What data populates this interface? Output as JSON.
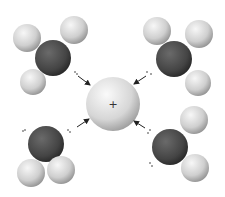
{
  "diagram": {
    "title": "",
    "colors": {
      "background": "#ffffff",
      "oxygen": "#4a4a4a",
      "hydrogen": "#d8d8d8",
      "cation": "#e0e0e0",
      "arrow": "#222222"
    },
    "cation": {
      "label": "+",
      "cx": 113,
      "cy": 104,
      "r": 27
    },
    "molecules": [
      {
        "id": "top-left",
        "oxygen": {
          "cx": 53,
          "cy": 58,
          "r": 18
        },
        "hydrogens": [
          {
            "cx": 27,
            "cy": 38,
            "r": 14
          },
          {
            "cx": 74,
            "cy": 30,
            "r": 14
          },
          {
            "cx": 33,
            "cy": 82,
            "r": 13
          }
        ]
      },
      {
        "id": "top-right",
        "oxygen": {
          "cx": 174,
          "cy": 59,
          "r": 18
        },
        "hydrogens": [
          {
            "cx": 157,
            "cy": 31,
            "r": 14
          },
          {
            "cx": 199,
            "cy": 34,
            "r": 14
          },
          {
            "cx": 198,
            "cy": 83,
            "r": 13
          }
        ]
      },
      {
        "id": "bottom-left",
        "oxygen": {
          "cx": 46,
          "cy": 144,
          "r": 18
        },
        "hydrogens": [
          {
            "cx": 31,
            "cy": 173,
            "r": 14
          },
          {
            "cx": 61,
            "cy": 170,
            "r": 14
          }
        ]
      },
      {
        "id": "bottom-right",
        "oxygen": {
          "cx": 170,
          "cy": 147,
          "r": 18
        },
        "hydrogens": [
          {
            "cx": 194,
            "cy": 120,
            "r": 14
          },
          {
            "cx": 195,
            "cy": 168,
            "r": 14
          }
        ]
      }
    ],
    "arrows": [
      {
        "x1": 76,
        "y1": 76,
        "x2": 91,
        "y2": 86
      },
      {
        "x1": 146,
        "y1": 76,
        "x2": 133,
        "y2": 84
      },
      {
        "x1": 77,
        "y1": 127,
        "x2": 88,
        "y2": 118
      },
      {
        "x1": 145,
        "y1": 128,
        "x2": 133,
        "y2": 120
      }
    ]
  }
}
